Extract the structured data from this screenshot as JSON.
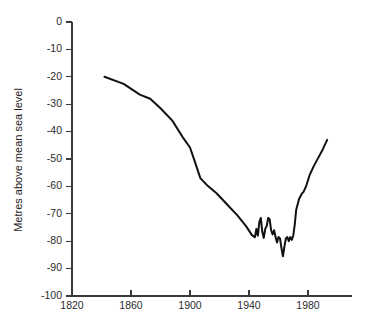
{
  "chart_data": {
    "type": "line",
    "title": "",
    "subtitle": "",
    "xlabel": "",
    "ylabel": "Metres above mean sea level",
    "xlim": [
      1820,
      2000
    ],
    "ylim": [
      -100,
      0
    ],
    "xticks": [
      1820,
      1860,
      1900,
      1940,
      1980
    ],
    "yticks": [
      0,
      -10,
      -20,
      -30,
      -40,
      -50,
      -60,
      -70,
      -80,
      -90,
      -100
    ],
    "xtick_labels": [
      "1820",
      "1860",
      "1900",
      "1940",
      "1980"
    ],
    "ytick_labels": [
      "0",
      "-10",
      "-20",
      "-30",
      "-40",
      "-50",
      "-60",
      "-70",
      "-80",
      "-90",
      "-100"
    ],
    "grid": false,
    "legend": false,
    "legend_position": "none",
    "series": [
      {
        "name": "Lake level",
        "color": "#111111",
        "x": [
          1842,
          1855,
          1866,
          1873,
          1880,
          1888,
          1895,
          1900,
          1903,
          1907,
          1912,
          1918,
          1925,
          1932,
          1938,
          1942,
          1944,
          1945,
          1946,
          1947,
          1948,
          1949,
          1950,
          1951,
          1952,
          1953,
          1954,
          1955,
          1956,
          1957,
          1958,
          1959,
          1960,
          1961,
          1962,
          1963,
          1964,
          1965,
          1966,
          1967,
          1968,
          1969,
          1970,
          1971,
          1972,
          1974,
          1976,
          1977,
          1979,
          1981,
          1984,
          1987,
          1990,
          1993
        ],
        "y": [
          -20.0,
          -22.6,
          -26.5,
          -28.0,
          -31.5,
          -36.0,
          -42.0,
          -45.8,
          -50.5,
          -57.0,
          -59.8,
          -62.5,
          -66.5,
          -70.5,
          -74.5,
          -77.8,
          -78.5,
          -75.5,
          -78.0,
          -73.0,
          -71.5,
          -76.5,
          -78.8,
          -75.5,
          -74.5,
          -71.5,
          -72.0,
          -76.0,
          -77.5,
          -76.0,
          -78.5,
          -80.5,
          -78.5,
          -79.0,
          -82.5,
          -85.5,
          -82.0,
          -79.0,
          -78.5,
          -80.0,
          -78.5,
          -79.5,
          -78.0,
          -74.0,
          -68.5,
          -64.5,
          -62.5,
          -62.0,
          -59.5,
          -56.0,
          -52.5,
          -49.5,
          -46.5,
          -43.0
        ]
      }
    ],
    "annotations": []
  },
  "layout": {
    "axis_color": "#3a3a3a",
    "line_color": "#111111",
    "background": "#ffffff"
  }
}
